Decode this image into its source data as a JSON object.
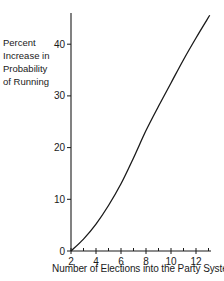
{
  "chart_data": {
    "type": "line",
    "title": "",
    "xlabel": "Number of Elections into the Party System",
    "ylabel": "Percent Increase in Probability of Running",
    "ylabel_lines": [
      "Percent",
      "Increase in",
      "Probability",
      "of Running"
    ],
    "xlim": [
      2,
      13.2
    ],
    "ylim": [
      0,
      46
    ],
    "x_ticks": [
      2,
      4,
      6,
      8,
      10,
      12
    ],
    "x_minor_ticks": [
      3,
      5,
      7,
      9,
      11,
      13
    ],
    "y_ticks": [
      0,
      10,
      20,
      30,
      40
    ],
    "grid": false,
    "legend": null,
    "series": [
      {
        "name": "Percent Increase in Probability of Running",
        "x": [
          2,
          3,
          4,
          5,
          6,
          7,
          8,
          9,
          10,
          11,
          12,
          13.1
        ],
        "y": [
          0,
          2.3,
          5.2,
          8.8,
          13.0,
          18.0,
          23.3,
          28.0,
          32.5,
          37.0,
          41.2,
          45.6
        ]
      }
    ]
  }
}
